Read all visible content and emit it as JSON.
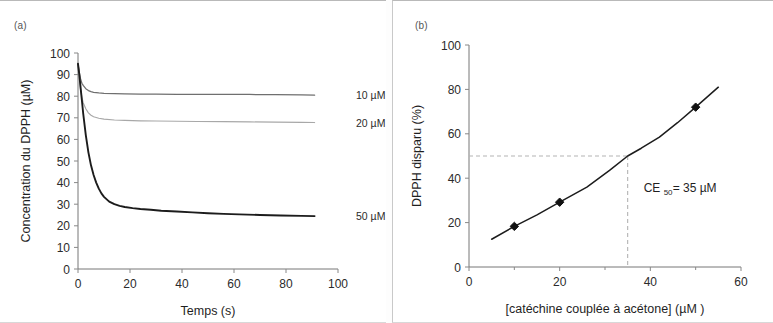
{
  "figure": {
    "panel_a_tag": "(a)",
    "panel_b_tag": "(b)"
  },
  "chart_data": [
    {
      "type": "line",
      "panel": "(a)",
      "title": "",
      "xlabel": "Temps (s)",
      "ylabel": "Concentration du DPPH (µM)",
      "xlim": [
        0,
        100
      ],
      "ylim": [
        0,
        100
      ],
      "xticks": [
        0,
        20,
        40,
        60,
        80,
        100
      ],
      "yticks": [
        0,
        10,
        20,
        30,
        40,
        50,
        60,
        70,
        80,
        90,
        100
      ],
      "grid": false,
      "legend_position": "right-of-plot-inline",
      "series": [
        {
          "name": "10 µM",
          "label": "10 µM",
          "color": "#6f6f6f",
          "x": [
            0,
            0.5,
            1,
            1.5,
            2,
            3,
            4,
            5,
            6,
            8,
            10,
            14,
            18,
            24,
            30,
            38,
            46,
            56,
            66,
            76,
            86,
            91
          ],
          "y": [
            95,
            91,
            88,
            86,
            85,
            83.5,
            82.6,
            82.1,
            81.8,
            81.5,
            81.3,
            81.2,
            81.1,
            81.0,
            81.0,
            80.9,
            80.9,
            80.8,
            80.8,
            80.7,
            80.6,
            80.5
          ]
        },
        {
          "name": "20 µM",
          "label": "20 µM",
          "color": "#a8a8a8",
          "x": [
            0,
            0.5,
            1,
            1.5,
            2,
            3,
            4,
            5,
            6,
            8,
            10,
            14,
            18,
            24,
            30,
            38,
            46,
            56,
            66,
            76,
            86,
            91
          ],
          "y": [
            94,
            88,
            83,
            79.5,
            77,
            74.2,
            72.3,
            71.2,
            70.5,
            69.8,
            69.4,
            69.0,
            68.8,
            68.6,
            68.5,
            68.4,
            68.3,
            68.2,
            68.1,
            68.0,
            67.9,
            67.8
          ]
        },
        {
          "name": "50 µM",
          "label": "50 µM",
          "color": "#1c1c1c",
          "x": [
            0,
            0.5,
            1,
            1.5,
            2,
            3,
            4,
            5,
            6,
            7,
            8,
            9,
            10,
            12,
            14,
            16,
            18,
            21,
            24,
            28,
            32,
            38,
            44,
            50,
            56,
            62,
            70,
            78,
            86,
            91
          ],
          "y": [
            95,
            90,
            84,
            78,
            72,
            62,
            54,
            48,
            43.5,
            40,
            37.2,
            35,
            33.4,
            31.2,
            30,
            29.2,
            28.7,
            28.2,
            27.8,
            27.4,
            27.0,
            26.6,
            26.2,
            25.8,
            25.5,
            25.3,
            25.0,
            24.8,
            24.6,
            24.5
          ]
        }
      ]
    },
    {
      "type": "line",
      "panel": "(b)",
      "title": "",
      "xlabel": "[catéchine couplée à acétone] (µM )",
      "ylabel": "DPPH disparu (%)",
      "xlim": [
        0,
        60
      ],
      "ylim": [
        0,
        100
      ],
      "xticks": [
        0,
        20,
        40,
        60
      ],
      "yticks": [
        0,
        20,
        40,
        60,
        80,
        100
      ],
      "grid": false,
      "legend_position": "none",
      "annotation": {
        "text": "CE",
        "subscript": "50",
        "value_text": " = 35 µM",
        "full_text": "CE50 = 35 µM",
        "ce50_x": 35,
        "ce50_y": 50
      },
      "guides": {
        "horizontal_y": 50,
        "vertical_x": 35,
        "style": "dashed",
        "color": "#b3b3b3"
      },
      "series": [
        {
          "name": "DPPH disparu",
          "color": "#1c1c1c",
          "marker": "diamond",
          "x": [
            5,
            10,
            15,
            20,
            26,
            31,
            35,
            38,
            42,
            46,
            50,
            55
          ],
          "y": [
            12.5,
            18.3,
            23.5,
            29.2,
            36.0,
            43.5,
            50.0,
            53.5,
            58.5,
            65.0,
            72.0,
            81.0
          ],
          "markers_x": [
            10,
            20,
            50
          ],
          "markers_y": [
            18.3,
            29.2,
            72.0
          ]
        }
      ]
    }
  ]
}
